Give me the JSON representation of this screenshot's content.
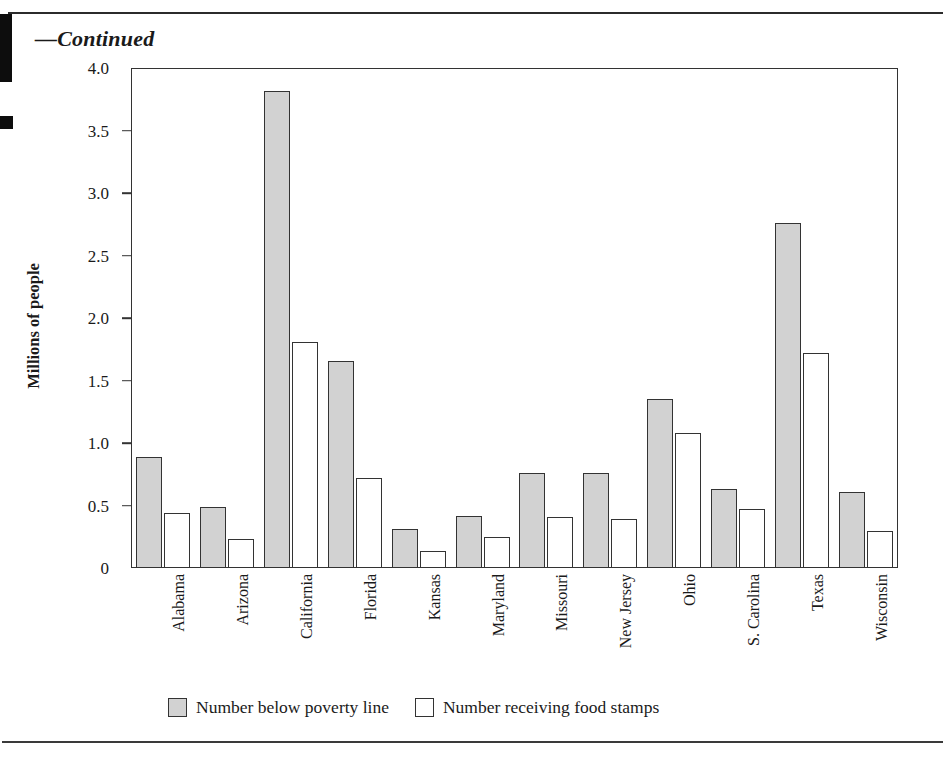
{
  "page": {
    "continued_label": "—Continued"
  },
  "legend": {
    "items": [
      {
        "label": "Number below poverty line",
        "swatch": "gray-filled-square-icon",
        "color": "#d2d2d2"
      },
      {
        "label": "Number receiving food stamps",
        "swatch": "white-outlined-square-icon",
        "color": "#ffffff"
      }
    ]
  },
  "chart_data": {
    "type": "bar",
    "title": "",
    "xlabel": "",
    "ylabel": "Millions of people",
    "ylim": [
      0,
      4.0
    ],
    "yticks": [
      0,
      0.5,
      1.0,
      1.5,
      2.0,
      2.5,
      3.0,
      3.5,
      4.0
    ],
    "ytick_labels": [
      "0",
      "0.5",
      "1.0",
      "1.5",
      "2.0",
      "2.5",
      "3.0",
      "3.5",
      "4.0"
    ],
    "grid": false,
    "legend_position": "bottom",
    "categories": [
      "Alabama",
      "Arizona",
      "California",
      "Florida",
      "Kansas",
      "Maryland",
      "Missouri",
      "New Jersey",
      "Ohio",
      "S. Carolina",
      "Texas",
      "Wisconsin"
    ],
    "series": [
      {
        "name": "Number below poverty line",
        "color": "#d2d2d2",
        "values": [
          0.89,
          0.49,
          3.82,
          1.66,
          0.31,
          0.42,
          0.76,
          0.76,
          1.35,
          0.63,
          2.76,
          0.61
        ]
      },
      {
        "name": "Number receiving food stamps",
        "color": "#ffffff",
        "values": [
          0.44,
          0.23,
          1.81,
          0.72,
          0.14,
          0.25,
          0.41,
          0.39,
          1.08,
          0.47,
          1.72,
          0.3
        ]
      }
    ]
  }
}
